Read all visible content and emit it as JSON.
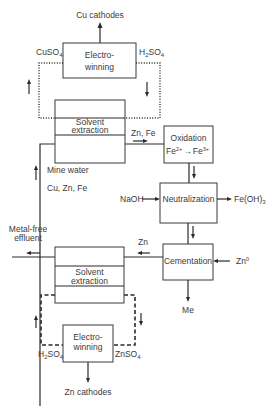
{
  "colors": {
    "line": "#2a2a2a",
    "text": "#3a3a3a",
    "background": "#ffffff"
  },
  "copper_circuit": {
    "product": "Cu cathodes",
    "electrowinning": {
      "line1": "Electro-",
      "line2": "winning"
    },
    "feed_to_ew": {
      "base": "CuSO",
      "sub": "4"
    },
    "return_from_ew": {
      "base": "H",
      "sub": "2",
      "base2": "SO",
      "sub2": "4"
    },
    "solvent_extraction": {
      "line1": "Solvent",
      "line2": "extraction"
    },
    "raffinate": "Zn, Fe"
  },
  "feed": {
    "line1": "Mine  water",
    "line2": "Cu, Zn, Fe"
  },
  "oxidation": {
    "title": "Oxidation",
    "reaction": {
      "a": "Fe",
      "a_sup": "2+",
      "arrow": "→",
      "b": "Fe",
      "b_sup": "3+"
    }
  },
  "neutralization": {
    "title": "Neutralization",
    "reagent": "NaOH",
    "product": {
      "base": "Fe(OH)",
      "sub": "3"
    }
  },
  "cementation": {
    "title": "Cementation",
    "reagent": {
      "base": "Zn",
      "sup": "0"
    },
    "product": "Me",
    "outflow": "Zn"
  },
  "zinc_circuit": {
    "effluent": {
      "line1": "Metal-free",
      "line2": "effluent"
    },
    "solvent_extraction": {
      "line1": "Solvent",
      "line2": "extraction"
    },
    "electrowinning": {
      "line1": "Electro-",
      "line2": "winning"
    },
    "return_from_ew": {
      "base": "H",
      "sub": "2",
      "base2": "SO",
      "sub2": "4"
    },
    "feed_to_ew": {
      "base": "ZnSO",
      "sub": "4"
    },
    "product": "Zn cathodes"
  }
}
